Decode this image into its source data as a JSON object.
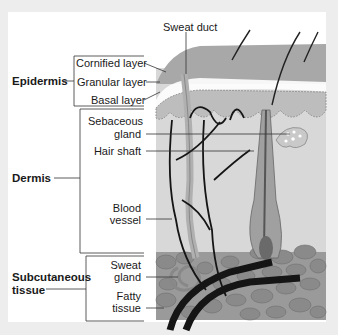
{
  "diagram": {
    "groups": [
      {
        "label": "Epidermis"
      },
      {
        "label": "Dermis"
      },
      {
        "label": "Subcutaneous tissue",
        "line1": "Subcutaneous",
        "line2": "tissue"
      }
    ],
    "labels": {
      "sweat_duct": "Sweat duct",
      "cornified_layer": "Cornified layer",
      "granular_layer": "Granular layer",
      "basal_layer": "Basal layer",
      "sebaceous_gland_1": "Sebaceous",
      "sebaceous_gland_2": "gland",
      "hair_shaft": "Hair shaft",
      "blood_vessel_1": "Blood",
      "blood_vessel_2": "vessel",
      "sweat_gland_1": "Sweat",
      "sweat_gland_2": "gland",
      "fatty_tissue_1": "Fatty",
      "fatty_tissue_2": "tissue"
    },
    "colors": {
      "background": "#ededed",
      "panel": "#ffffff",
      "skin_surface": "#a9a9a9",
      "dermis": "#d6d6d6",
      "fat": "#8f8f8f",
      "vessel": "#1a1a1a",
      "lines": "#333333"
    }
  }
}
